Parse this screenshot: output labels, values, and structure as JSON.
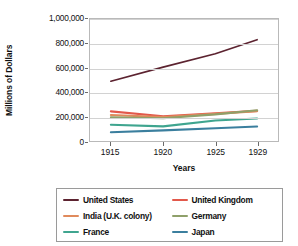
{
  "chart_data": {
    "type": "line",
    "title": "",
    "xlabel": "Years",
    "ylabel": "Millions of Dollars",
    "x": [
      1915,
      1920,
      1925,
      1929
    ],
    "xtick_labels": [
      "1915",
      "1920",
      "1925",
      "1929"
    ],
    "xlim": [
      1913,
      1931
    ],
    "ylim": [
      0,
      1000000
    ],
    "ytick_labels": [
      "0",
      "200,000",
      "400,000",
      "600,000",
      "800,000",
      "1,000,000"
    ],
    "ytick_values": [
      0,
      200000,
      400000,
      600000,
      800000,
      1000000
    ],
    "grid": "horizontal",
    "legend_position": "below",
    "series": [
      {
        "name": "United States",
        "color": "#5c2330",
        "values": [
          490000,
          605000,
          715000,
          830000
        ]
      },
      {
        "name": "United Kingdom",
        "color": "#e2584b",
        "values": [
          243000,
          203000,
          228000,
          247000
        ]
      },
      {
        "name": "India (U.K. colony)",
        "color": "#e08a5c",
        "values": [
          213000,
          196000,
          222000,
          245000
        ]
      },
      {
        "name": "Germany",
        "color": "#8fa06a",
        "values": [
          195000,
          186000,
          218000,
          252000
        ]
      },
      {
        "name": "France",
        "color": "#3fa58f",
        "values": [
          133000,
          120000,
          168000,
          185000
        ]
      },
      {
        "name": "Japan",
        "color": "#3b7f9e",
        "values": [
          72000,
          87000,
          105000,
          119000
        ]
      }
    ]
  },
  "legend": {
    "items": [
      {
        "label": "United States",
        "color": "#5c2330"
      },
      {
        "label": "United Kingdom",
        "color": "#e2584b"
      },
      {
        "label": "India (U.K. colony)",
        "color": "#e08a5c"
      },
      {
        "label": "Germany",
        "color": "#8fa06a"
      },
      {
        "label": "France",
        "color": "#3fa58f"
      },
      {
        "label": "Japan",
        "color": "#3b7f9e"
      }
    ]
  }
}
